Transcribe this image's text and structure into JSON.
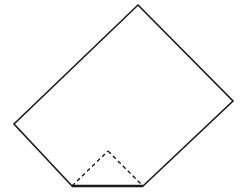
{
  "figure": {
    "name": "folded-paper-diagram",
    "canvas": {
      "width": 246,
      "height": 194,
      "background": "#ffffff"
    },
    "style": {
      "outline_color": "#1a1a1a",
      "outline_width": 1.6,
      "fold_color": "#1a1a1a",
      "fold_width": 1.4,
      "fold_dash": "4 3",
      "base_color": "#1a1a1a",
      "base_width": 2.4,
      "fill": "#ffffff"
    },
    "vertices": [
      {
        "label": "top",
        "x": 138,
        "y": 5
      },
      {
        "label": "right",
        "x": 233,
        "y": 101
      },
      {
        "label": "bottom-right",
        "x": 143,
        "y": 186
      },
      {
        "label": "bottom-left",
        "x": 72,
        "y": 186
      },
      {
        "label": "left",
        "x": 14,
        "y": 124
      }
    ],
    "outline_points": "138,5 233,101 143,186 72,186 14,124",
    "fold_triangle": {
      "apex": {
        "label": "fold-apex",
        "x": 108,
        "y": 151
      },
      "left": {
        "label": "bottom-left",
        "x": 72,
        "y": 186
      },
      "right": {
        "label": "bottom-right",
        "x": 143,
        "y": 186
      },
      "left_segment": "72,186 108,151",
      "right_segment": "108,151 143,186"
    },
    "base_edge": {
      "x1": 72,
      "y1": 186,
      "x2": 143,
      "y2": 186
    }
  }
}
